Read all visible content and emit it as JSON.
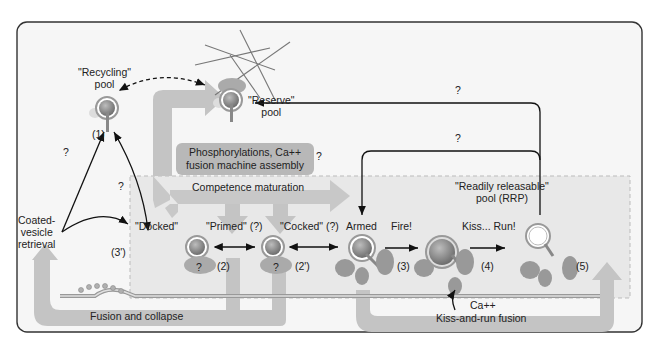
{
  "pools": {
    "recycling": "\"Recycling\" pool",
    "recycling_l1": "\"Recycling\"",
    "recycling_l2": "pool",
    "reserve_l1": "\"Reserve\"",
    "reserve_l2": "pool",
    "rrp_l1": "\"Readily releasable\"",
    "rrp_l2": "pool (RRP)"
  },
  "states": {
    "docked": "\"Docked\"",
    "primed": "\"Primed\" (?)",
    "cocked": "\"Cocked\" (?)",
    "armed": "Armed",
    "fire": "Fire!",
    "kiss_run": "Kiss... Run!"
  },
  "steps": {
    "s1": "(1)",
    "s2": "(2)",
    "s2p": "(2')",
    "s3": "(3)",
    "s3p": "(3')",
    "s4": "(4)",
    "s5": "(5)"
  },
  "processes": {
    "phosphorylation_l1": "Phosphorylations, Ca++",
    "phosphorylation_l2": "fusion machine assembly",
    "competence": "Competence maturation",
    "fusion_collapse": "Fusion and collapse",
    "kiss_and_run": "Kiss-and-run fusion",
    "coated_l1": "Coated-",
    "coated_l2": "vesicle",
    "coated_l3": "retrieval",
    "calcium": "Ca++"
  },
  "unknown_mark": "?",
  "colors": {
    "border": "#333333",
    "panel": "#f4f4f4",
    "rrp_area": "#ececec",
    "arrow_fill": "#c4c4c4",
    "vesicle": "#8a8a8a",
    "membrane": "#9a9a9a",
    "protein": "#a0a0a0"
  }
}
